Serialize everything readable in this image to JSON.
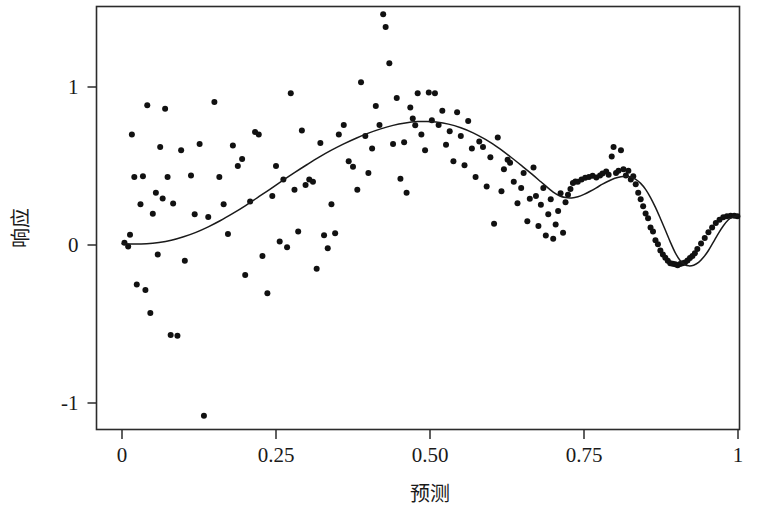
{
  "chart_data": {
    "type": "scatter",
    "title": "",
    "subtitle": "",
    "xlabel": "预测",
    "ylabel": "响应",
    "xlim": [
      -0.042,
      1.003
    ],
    "ylim": [
      -1.19,
      1.52
    ],
    "grid": false,
    "legend": null,
    "xticks": [
      0,
      0.25,
      0.5,
      0.75,
      1
    ],
    "xtick_labels": [
      "0",
      "0.25",
      "0.50",
      "0.75",
      "1"
    ],
    "yticks": [
      -1,
      0,
      1
    ],
    "ytick_labels": [
      "-1",
      "0",
      "1"
    ],
    "point_color": "#111111",
    "curve_color": "#1a1a1a",
    "frame_color": "#2b2b2b",
    "background_color": "#ffffff",
    "marker_size": 3.0,
    "series": [
      {
        "name": "observations",
        "type": "scatter",
        "points": [
          [
            0.004,
            0.015
          ],
          [
            0.01,
            -0.01
          ],
          [
            0.013,
            0.065
          ],
          [
            0.016,
            0.7
          ],
          [
            0.02,
            0.43
          ],
          [
            0.024,
            -0.25
          ],
          [
            0.03,
            0.258
          ],
          [
            0.034,
            0.435
          ],
          [
            0.038,
            -0.285
          ],
          [
            0.041,
            0.885
          ],
          [
            0.046,
            -0.43
          ],
          [
            0.05,
            0.198
          ],
          [
            0.055,
            0.33
          ],
          [
            0.058,
            -0.06
          ],
          [
            0.062,
            0.62
          ],
          [
            0.066,
            0.295
          ],
          [
            0.07,
            0.862
          ],
          [
            0.074,
            0.43
          ],
          [
            0.079,
            -0.57
          ],
          [
            0.083,
            0.262
          ],
          [
            0.09,
            -0.575
          ],
          [
            0.096,
            0.6
          ],
          [
            0.102,
            -0.1
          ],
          [
            0.112,
            0.44
          ],
          [
            0.118,
            0.195
          ],
          [
            0.126,
            0.64
          ],
          [
            0.133,
            -1.08
          ],
          [
            0.14,
            0.178
          ],
          [
            0.15,
            0.905
          ],
          [
            0.158,
            0.43
          ],
          [
            0.165,
            0.258
          ],
          [
            0.172,
            0.07
          ],
          [
            0.18,
            0.63
          ],
          [
            0.188,
            0.5
          ],
          [
            0.195,
            0.545
          ],
          [
            0.2,
            -0.19
          ],
          [
            0.208,
            0.275
          ],
          [
            0.216,
            0.715
          ],
          [
            0.222,
            0.7
          ],
          [
            0.228,
            -0.07
          ],
          [
            0.236,
            -0.305
          ],
          [
            0.244,
            0.31
          ],
          [
            0.25,
            0.5
          ],
          [
            0.256,
            0.022
          ],
          [
            0.262,
            0.415
          ],
          [
            0.268,
            -0.015
          ],
          [
            0.274,
            0.96
          ],
          [
            0.28,
            0.35
          ],
          [
            0.286,
            0.085
          ],
          [
            0.292,
            0.725
          ],
          [
            0.298,
            0.38
          ],
          [
            0.304,
            0.415
          ],
          [
            0.31,
            0.4
          ],
          [
            0.316,
            -0.15
          ],
          [
            0.322,
            0.645
          ],
          [
            0.328,
            0.062
          ],
          [
            0.334,
            -0.02
          ],
          [
            0.34,
            0.258
          ],
          [
            0.346,
            0.075
          ],
          [
            0.352,
            0.7
          ],
          [
            0.36,
            0.76
          ],
          [
            0.368,
            0.53
          ],
          [
            0.375,
            0.495
          ],
          [
            0.382,
            0.35
          ],
          [
            0.388,
            1.03
          ],
          [
            0.395,
            0.69
          ],
          [
            0.4,
            0.455
          ],
          [
            0.406,
            0.61
          ],
          [
            0.412,
            0.88
          ],
          [
            0.418,
            0.76
          ],
          [
            0.424,
            1.46
          ],
          [
            0.428,
            1.38
          ],
          [
            0.434,
            1.15
          ],
          [
            0.44,
            0.64
          ],
          [
            0.446,
            0.93
          ],
          [
            0.452,
            0.42
          ],
          [
            0.458,
            0.65
          ],
          [
            0.462,
            0.33
          ],
          [
            0.468,
            0.87
          ],
          [
            0.472,
            0.8
          ],
          [
            0.476,
            0.758
          ],
          [
            0.48,
            0.96
          ],
          [
            0.486,
            0.7
          ],
          [
            0.492,
            0.6
          ],
          [
            0.498,
            0.965
          ],
          [
            0.503,
            0.79
          ],
          [
            0.508,
            0.96
          ],
          [
            0.514,
            0.76
          ],
          [
            0.52,
            0.85
          ],
          [
            0.526,
            0.635
          ],
          [
            0.532,
            0.72
          ],
          [
            0.538,
            0.53
          ],
          [
            0.544,
            0.84
          ],
          [
            0.55,
            0.69
          ],
          [
            0.556,
            0.505
          ],
          [
            0.562,
            0.785
          ],
          [
            0.568,
            0.61
          ],
          [
            0.574,
            0.43
          ],
          [
            0.58,
            0.655
          ],
          [
            0.586,
            0.62
          ],
          [
            0.592,
            0.37
          ],
          [
            0.598,
            0.555
          ],
          [
            0.604,
            0.135
          ],
          [
            0.61,
            0.68
          ],
          [
            0.616,
            0.34
          ],
          [
            0.62,
            0.48
          ],
          [
            0.626,
            0.54
          ],
          [
            0.63,
            0.52
          ],
          [
            0.636,
            0.4
          ],
          [
            0.642,
            0.265
          ],
          [
            0.648,
            0.36
          ],
          [
            0.652,
            0.455
          ],
          [
            0.658,
            0.15
          ],
          [
            0.662,
            0.292
          ],
          [
            0.668,
            0.49
          ],
          [
            0.672,
            0.31
          ],
          [
            0.676,
            0.12
          ],
          [
            0.68,
            0.255
          ],
          [
            0.684,
            0.36
          ],
          [
            0.688,
            0.06
          ],
          [
            0.692,
            0.195
          ],
          [
            0.696,
            0.29
          ],
          [
            0.7,
            0.04
          ],
          [
            0.704,
            0.13
          ],
          [
            0.708,
            0.215
          ],
          [
            0.712,
            0.328
          ],
          [
            0.716,
            0.078
          ],
          [
            0.72,
            0.27
          ],
          [
            0.724,
            0.318
          ],
          [
            0.728,
            0.355
          ],
          [
            0.732,
            0.392
          ],
          [
            0.736,
            0.402
          ],
          [
            0.74,
            0.4
          ],
          [
            0.746,
            0.415
          ],
          [
            0.752,
            0.425
          ],
          [
            0.758,
            0.43
          ],
          [
            0.764,
            0.438
          ],
          [
            0.77,
            0.428
          ],
          [
            0.776,
            0.44
          ],
          [
            0.78,
            0.452
          ],
          [
            0.786,
            0.465
          ],
          [
            0.79,
            0.445
          ],
          [
            0.795,
            0.56
          ],
          [
            0.798,
            0.62
          ],
          [
            0.802,
            0.455
          ],
          [
            0.806,
            0.47
          ],
          [
            0.81,
            0.6
          ],
          [
            0.814,
            0.48
          ],
          [
            0.818,
            0.44
          ],
          [
            0.822,
            0.47
          ],
          [
            0.826,
            0.415
          ],
          [
            0.83,
            0.435
          ],
          [
            0.834,
            0.385
          ],
          [
            0.838,
            0.33
          ],
          [
            0.842,
            0.29
          ],
          [
            0.846,
            0.245
          ],
          [
            0.85,
            0.2
          ],
          [
            0.854,
            0.17
          ],
          [
            0.858,
            0.11
          ],
          [
            0.862,
            0.085
          ],
          [
            0.866,
            0.03
          ],
          [
            0.87,
            0.005
          ],
          [
            0.874,
            -0.035
          ],
          [
            0.878,
            -0.06
          ],
          [
            0.882,
            -0.08
          ],
          [
            0.886,
            -0.1
          ],
          [
            0.89,
            -0.115
          ],
          [
            0.894,
            -0.118
          ],
          [
            0.898,
            -0.122
          ],
          [
            0.902,
            -0.128
          ],
          [
            0.906,
            -0.12
          ],
          [
            0.91,
            -0.115
          ],
          [
            0.914,
            -0.11
          ],
          [
            0.918,
            -0.098
          ],
          [
            0.922,
            -0.082
          ],
          [
            0.926,
            -0.07
          ],
          [
            0.93,
            -0.052
          ],
          [
            0.934,
            -0.025
          ],
          [
            0.94,
            0.01
          ],
          [
            0.946,
            0.045
          ],
          [
            0.952,
            0.08
          ],
          [
            0.958,
            0.11
          ],
          [
            0.964,
            0.14
          ],
          [
            0.97,
            0.16
          ],
          [
            0.976,
            0.175
          ],
          [
            0.982,
            0.182
          ],
          [
            0.988,
            0.185
          ],
          [
            0.994,
            0.185
          ],
          [
            0.999,
            0.182
          ]
        ]
      },
      {
        "name": "fitted-curve",
        "type": "line",
        "points": [
          [
            0.0,
            0.008
          ],
          [
            0.02,
            0.006
          ],
          [
            0.04,
            0.008
          ],
          [
            0.06,
            0.016
          ],
          [
            0.08,
            0.03
          ],
          [
            0.1,
            0.052
          ],
          [
            0.12,
            0.08
          ],
          [
            0.14,
            0.115
          ],
          [
            0.16,
            0.155
          ],
          [
            0.18,
            0.2
          ],
          [
            0.2,
            0.248
          ],
          [
            0.22,
            0.3
          ],
          [
            0.24,
            0.352
          ],
          [
            0.26,
            0.406
          ],
          [
            0.28,
            0.458
          ],
          [
            0.3,
            0.508
          ],
          [
            0.32,
            0.556
          ],
          [
            0.34,
            0.6
          ],
          [
            0.36,
            0.64
          ],
          [
            0.38,
            0.676
          ],
          [
            0.4,
            0.708
          ],
          [
            0.42,
            0.735
          ],
          [
            0.44,
            0.757
          ],
          [
            0.46,
            0.772
          ],
          [
            0.48,
            0.781
          ],
          [
            0.495,
            0.782
          ],
          [
            0.51,
            0.778
          ],
          [
            0.53,
            0.765
          ],
          [
            0.55,
            0.742
          ],
          [
            0.57,
            0.71
          ],
          [
            0.59,
            0.668
          ],
          [
            0.61,
            0.618
          ],
          [
            0.63,
            0.56
          ],
          [
            0.65,
            0.498
          ],
          [
            0.665,
            0.45
          ],
          [
            0.68,
            0.4
          ],
          [
            0.692,
            0.36
          ],
          [
            0.7,
            0.335
          ],
          [
            0.71,
            0.312
          ],
          [
            0.72,
            0.3
          ],
          [
            0.73,
            0.298
          ],
          [
            0.74,
            0.305
          ],
          [
            0.75,
            0.32
          ],
          [
            0.76,
            0.34
          ],
          [
            0.77,
            0.362
          ],
          [
            0.78,
            0.385
          ],
          [
            0.79,
            0.405
          ],
          [
            0.8,
            0.422
          ],
          [
            0.81,
            0.432
          ],
          [
            0.818,
            0.435
          ],
          [
            0.826,
            0.43
          ],
          [
            0.834,
            0.415
          ],
          [
            0.842,
            0.39
          ],
          [
            0.85,
            0.352
          ],
          [
            0.858,
            0.3
          ],
          [
            0.866,
            0.238
          ],
          [
            0.874,
            0.168
          ],
          [
            0.882,
            0.095
          ],
          [
            0.89,
            0.02
          ],
          [
            0.898,
            -0.048
          ],
          [
            0.906,
            -0.098
          ],
          [
            0.914,
            -0.125
          ],
          [
            0.92,
            -0.132
          ],
          [
            0.928,
            -0.128
          ],
          [
            0.936,
            -0.11
          ],
          [
            0.944,
            -0.078
          ],
          [
            0.952,
            -0.035
          ],
          [
            0.96,
            0.018
          ],
          [
            0.968,
            0.072
          ],
          [
            0.976,
            0.12
          ],
          [
            0.984,
            0.158
          ],
          [
            0.992,
            0.178
          ],
          [
            1.0,
            0.185
          ]
        ]
      }
    ]
  },
  "figure": {
    "alt": "散点图与拟合曲线"
  }
}
